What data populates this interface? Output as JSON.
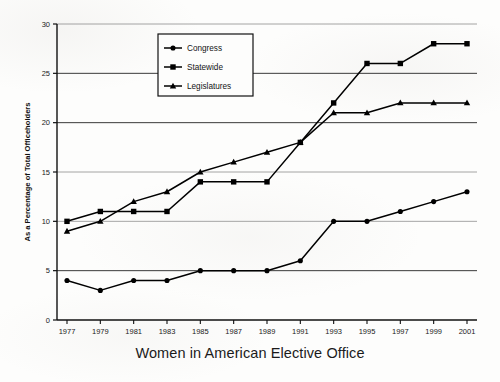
{
  "chart_data": {
    "type": "line",
    "title": "Women in American Elective Office",
    "xlabel": "",
    "ylabel": "As a Percentage of Total Officeholders",
    "categories": [
      "1977",
      "1979",
      "1981",
      "1983",
      "1985",
      "1987",
      "1989",
      "1991",
      "1993",
      "1995",
      "1997",
      "1999",
      "2001"
    ],
    "x_tick_labels": [
      "1977",
      "1979",
      "1981",
      "1983",
      "1985",
      "1987",
      "1989",
      "1991",
      "1993",
      "1995",
      "1997",
      "1999",
      "2001"
    ],
    "y_tick_labels": [
      "0",
      "5",
      "10",
      "15",
      "20",
      "25",
      "30"
    ],
    "y_ticks": [
      0,
      5,
      10,
      15,
      20,
      25,
      30
    ],
    "ylim": [
      0,
      30
    ],
    "grid": "horizontal",
    "legend_position": "top-center-inside",
    "series": [
      {
        "name": "Congress",
        "marker": "circle",
        "color": "#000000",
        "values": [
          4,
          3,
          4,
          4,
          5,
          5,
          5,
          6,
          10,
          10,
          11,
          12,
          13
        ]
      },
      {
        "name": "Statewide",
        "marker": "square",
        "color": "#000000",
        "values": [
          10,
          11,
          11,
          11,
          14,
          14,
          14,
          18,
          22,
          26,
          26,
          28,
          28
        ]
      },
      {
        "name": "Legislatures",
        "marker": "triangle",
        "color": "#000000",
        "values": [
          9,
          10,
          12,
          13,
          15,
          16,
          17,
          18,
          21,
          21,
          22,
          22,
          22
        ]
      }
    ]
  },
  "legend": {
    "entries": [
      {
        "label": "Congress"
      },
      {
        "label": "Statewide"
      },
      {
        "label": "Legislatures"
      }
    ]
  },
  "caption": {
    "text": "Women in American Elective Office"
  }
}
